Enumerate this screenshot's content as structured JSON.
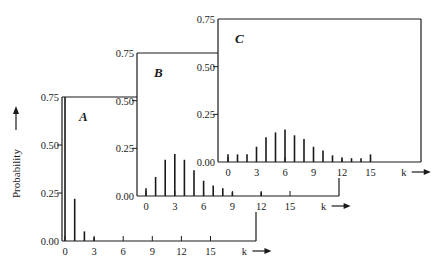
{
  "figure": {
    "ylabel": "Probability",
    "xlabel": "k",
    "colors": {
      "line": "#1a1a1a",
      "background": "#ffffff"
    }
  },
  "chart_data": [
    {
      "type": "bar",
      "panel": "A",
      "title": "A",
      "xlabel": "k",
      "ylabel": "Probability",
      "x": [
        0,
        1,
        2,
        3
      ],
      "values": [
        0.75,
        0.22,
        0.05,
        0.02
      ],
      "xticks": [
        "0",
        "3",
        "6",
        "9",
        "12",
        "15"
      ],
      "yticks": [
        "0.00",
        "0.25",
        "0.50",
        "0.75"
      ],
      "ylim": [
        0,
        0.75
      ],
      "xlim": [
        -1,
        19
      ]
    },
    {
      "type": "bar",
      "panel": "B",
      "title": "B",
      "xlabel": "k",
      "ylabel": "Probability",
      "x": [
        0,
        1,
        2,
        3,
        4,
        5,
        6,
        7,
        8,
        9,
        12
      ],
      "values": [
        0.04,
        0.1,
        0.19,
        0.22,
        0.19,
        0.135,
        0.08,
        0.055,
        0.04,
        0.02,
        0.02
      ],
      "xticks": [
        "0",
        "3",
        "6",
        "9",
        "12",
        "15"
      ],
      "yticks": [
        "0.00",
        "0.25",
        "0.50",
        "0.75"
      ],
      "ylim": [
        0,
        0.75
      ],
      "xlim": [
        -1,
        19
      ]
    },
    {
      "type": "bar",
      "panel": "C",
      "title": "C",
      "xlabel": "k",
      "ylabel": "Probability",
      "x": [
        0,
        1,
        2,
        3,
        4,
        5,
        6,
        7,
        8,
        9,
        10,
        11,
        12,
        13,
        14,
        15
      ],
      "values": [
        0.04,
        0.04,
        0.04,
        0.08,
        0.13,
        0.155,
        0.17,
        0.14,
        0.12,
        0.08,
        0.06,
        0.035,
        0.02,
        0.02,
        0.02,
        0.04
      ],
      "xticks": [
        "0",
        "3",
        "6",
        "9",
        "12",
        "15"
      ],
      "yticks": [
        "0.00",
        "0.25",
        "0.50",
        "0.75"
      ],
      "ylim": [
        0,
        0.75
      ],
      "xlim": [
        -1,
        19
      ]
    }
  ]
}
